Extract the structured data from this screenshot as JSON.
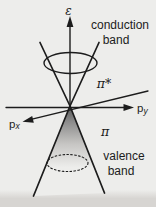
{
  "figure": {
    "colors": {
      "background": "#ededeb",
      "bottom_strip": "#d7d5d2",
      "ink": "#1c1c1c",
      "cone_fill_dark": "#565656"
    },
    "labels": {
      "energy_axis": "ε",
      "conduction_line1": "conduction",
      "conduction_line2": "band",
      "pi_star": "π*",
      "pi": "π",
      "momentum_x_base": "p",
      "momentum_x_sub": "x",
      "momentum_y_base": "p",
      "momentum_y_sub": "y",
      "valence_line1": "valence",
      "valence_line2": "band"
    }
  }
}
